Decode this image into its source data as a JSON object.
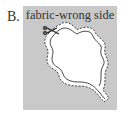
{
  "figure": {
    "label": "B.",
    "panel_title": "fabric-wrong side",
    "colors": {
      "panel": "#c9c9c9",
      "shape": "#ffffff",
      "line": "#333333"
    },
    "elements": [
      "leaf-shape-outline",
      "dashed-seam-allowance",
      "scissors-icon"
    ]
  }
}
